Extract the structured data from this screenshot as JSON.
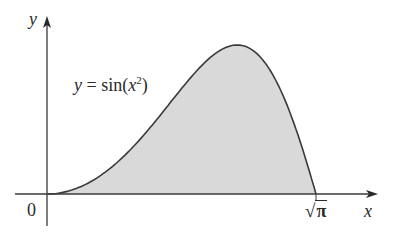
{
  "chart_data": {
    "type": "area",
    "title": "",
    "function": "y = sin(x^2)",
    "curve_label": {
      "prefix": "y = sin(",
      "var": "x",
      "exp": "2",
      "suffix": ")"
    },
    "xlabel": "x",
    "ylabel": "y",
    "x_ticks": [
      {
        "value": 0,
        "label": "0"
      },
      {
        "value": 1.7725,
        "label": "√π",
        "radicand": "π"
      }
    ],
    "xlim": [
      0,
      1.7725
    ],
    "ylim": [
      0,
      1
    ],
    "shaded_region": "area under y = sin(x^2) from x = 0 to x = √π",
    "x": [
      0,
      0.2,
      0.4,
      0.6,
      0.8,
      1.0,
      1.2,
      1.2533,
      1.4,
      1.6,
      1.7725
    ],
    "values": [
      0,
      0.04,
      0.159,
      0.352,
      0.589,
      0.841,
      0.991,
      1.0,
      0.925,
      0.549,
      0
    ],
    "grid": false,
    "colors": {
      "fill": "#d9d9d9",
      "curve": "#3a3a3a",
      "axis": "#3a3a3a"
    }
  }
}
